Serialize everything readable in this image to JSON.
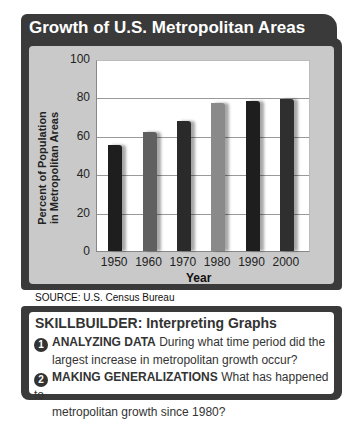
{
  "title": "Growth of U.S. Metropolitan Areas",
  "chart_data": {
    "type": "bar",
    "title": "Growth of U.S. Metropolitan Areas",
    "categories": [
      "1950",
      "1960",
      "1970",
      "1980",
      "1990",
      "2000"
    ],
    "values": [
      56,
      63,
      69,
      78,
      79,
      80
    ],
    "xlabel": "Year",
    "ylabel": "Percent of Population in Metropolitan Areas",
    "ylim": [
      0,
      100
    ],
    "yticks": [
      "0",
      "20",
      "40",
      "60",
      "80",
      "100"
    ],
    "grid": true,
    "bar_colors": [
      "#1e1e1e",
      "#606060",
      "#2a2a2a",
      "#8a8a8a",
      "#1e1e1e",
      "#2f2f2f"
    ]
  },
  "ylabel_line1": "Percent of Population",
  "ylabel_line2": "in Metropolitan Areas",
  "source": "SOURCE: U.S. Census Bureau",
  "skillbuilder": {
    "title": "SKILLBUILDER: Interpreting Graphs",
    "questions": [
      {
        "num": "1",
        "head": "ANALYZING DATA",
        "text": "During what time period did the",
        "cont": "largest increase in metropolitan growth occur?"
      },
      {
        "num": "2",
        "head": "MAKING GENERALIZATIONS",
        "text": "What has happened to",
        "cont": "metropolitan growth since 1980?"
      }
    ]
  }
}
